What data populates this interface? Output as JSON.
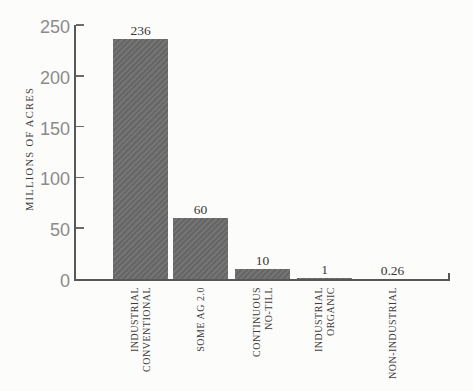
{
  "chart_data": {
    "type": "bar",
    "title": "",
    "xlabel": "",
    "ylabel": "MILLIONS OF ACRES",
    "categories": [
      "INDUSTRIAL\nCONVENTIONAL",
      "SOME AG 2.0",
      "CONTINUOUS\nNO-TILL",
      "INDUSTRIAL\nORGANIC",
      "NON-INDUSTRIAL"
    ],
    "values": [
      236,
      60,
      10,
      1,
      0.26
    ],
    "value_labels": [
      "236",
      "60",
      "10",
      "1",
      "0.26"
    ],
    "y_ticks": [
      0,
      50,
      100,
      150,
      200,
      250
    ],
    "ylim": [
      0,
      250
    ],
    "grid": false,
    "legend": null,
    "colors": {
      "bar": "#6d6d6d",
      "axis": "#575757",
      "tick_label": "#8b8b8b",
      "value_label": "#373737",
      "category_label": "#3c3c3c",
      "background": "#fcfcfb"
    }
  }
}
